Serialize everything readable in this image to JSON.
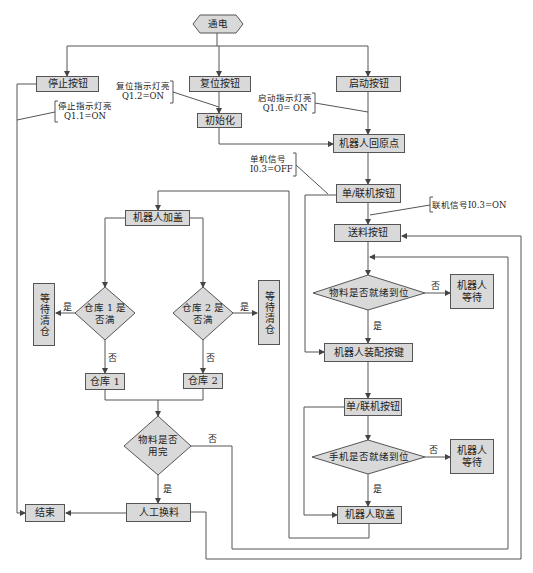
{
  "diagram": {
    "type": "flowchart",
    "nodes": {
      "power_on": "通电",
      "stop_button": "停止按钮",
      "reset_button": "复位按钮",
      "start_button": "启动按钮",
      "init": "初始化",
      "robot_home": "机器人回原点",
      "mode_button_1": "单/联机按钮",
      "feed_button": "送料按钮",
      "material_ready": "物料是否就绪到位",
      "robot_wait_1_line1": "机器人",
      "robot_wait_1_line2": "等待",
      "assembly_button": "机器人装配按键",
      "mode_button_2": "单/联机按钮",
      "phone_ready": "手机是否就绪到位",
      "robot_wait_2_line1": "机器人",
      "robot_wait_2_line2": "等待",
      "robot_take_cover": "机器人取盖",
      "robot_add_cover": "机器人加盖",
      "warehouse1_full_line1": "仓库 1 是",
      "warehouse1_full_line2": "否满",
      "warehouse2_full_line1": "仓库 2 是",
      "warehouse2_full_line2": "否满",
      "wait_clear_left": "等待清仓",
      "wait_clear_right": "等待清仓",
      "warehouse1": "仓库 1",
      "warehouse2": "仓库 2",
      "material_used_line1": "物料是否",
      "material_used_line2": "用完",
      "manual_refill": "人工换料",
      "end": "结束"
    },
    "annotations": {
      "stop_light_line1": "停止指示灯亮",
      "stop_light_line2": "Q1.1=ON",
      "reset_light_line1": "复位指示灯亮",
      "reset_light_line2": "Q1.2=ON",
      "start_light_line1": "启动指示灯亮",
      "start_light_line2": "Q1.0= ON",
      "single_signal_line1": "单机信号",
      "single_signal_line2": "I0.3=OFF",
      "online_signal": "联机信号I0.3=ON"
    },
    "edge_labels": {
      "material_ready_no": "否",
      "material_ready_yes": "是",
      "phone_ready_no": "否",
      "phone_ready_yes": "是",
      "wh1_yes": "是",
      "wh1_no": "否",
      "wh2_yes": "是",
      "wh2_no": "否",
      "material_used_no": "否",
      "material_used_yes": "是"
    },
    "colors": {
      "box_fill": "#d9d9d9",
      "stroke": "#555555"
    }
  }
}
